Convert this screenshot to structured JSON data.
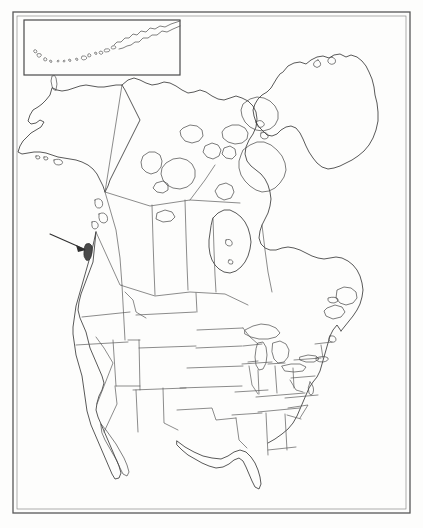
{
  "document": {
    "title": "North America Outline Map",
    "type": "scanned-outline-map",
    "background_color": "#fdfdfc",
    "line_color": "#3b3b3b",
    "highlight_color": "#4a4a4a"
  },
  "frame": {
    "name": "map-border",
    "outer": {
      "x": 13,
      "y": 12,
      "width": 397,
      "height": 501
    },
    "inner": {
      "x": 17,
      "y": 16,
      "width": 389,
      "height": 493
    }
  },
  "inset": {
    "name": "aleutian-islands-inset",
    "box": {
      "x": 24,
      "y": 20,
      "width": 156,
      "height": 55
    },
    "label": "",
    "contents": "Aleutian Islands chain and Alaska Peninsula"
  },
  "annotation": {
    "arrow": {
      "name": "locator-arrow",
      "from": {
        "x": 50,
        "y": 234
      },
      "to": {
        "x": 86,
        "y": 250
      },
      "points_to": "highlighted-island"
    },
    "highlighted_feature": {
      "name": "highlighted-island",
      "description": "filled dark island off the Pacific Northwest coast",
      "x": 88,
      "y": 252
    }
  },
  "regions": [
    {
      "name": "alaska",
      "label": "Alaska"
    },
    {
      "name": "canada",
      "label": "Canada"
    },
    {
      "name": "greenland",
      "label": "Greenland"
    },
    {
      "name": "united-states",
      "label": "United States"
    },
    {
      "name": "arctic-archipelago",
      "label": "Canadian Arctic Archipelago"
    },
    {
      "name": "hudson-bay",
      "label": "Hudson Bay"
    },
    {
      "name": "great-lakes",
      "label": "Great Lakes"
    },
    {
      "name": "florida-peninsula",
      "label": "Florida"
    },
    {
      "name": "baja-california",
      "label": "Baja California"
    },
    {
      "name": "newfoundland",
      "label": "Newfoundland"
    }
  ],
  "features": {
    "state_borders_visible": true,
    "province_borders_visible": true,
    "coastlines_visible": true,
    "grid_visible": false,
    "labels_visible": false
  }
}
